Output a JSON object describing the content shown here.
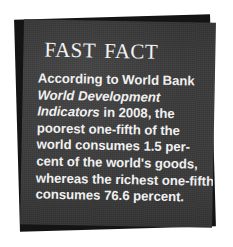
{
  "callout": {
    "kind": "fast-fact-callout",
    "title": "Fast Fact",
    "colors": {
      "page_background": "#ffffff",
      "card_front": "#3b3b3b",
      "card_back": "#141414",
      "text": "#f0f0f0",
      "title_text": "#f2f2f2"
    },
    "body": {
      "full_text": "According to World Bank World Development Indicators in 2008, the poorest one-fifth of the world consumes 1.5 percent of the world's goods, whereas the richest one-fifth consumes 76.6 percent.",
      "lines": [
        {
          "id": "line-1",
          "before": "According to World Bank",
          "italic": "",
          "after": ""
        },
        {
          "id": "line-2",
          "before": "",
          "italic": "World Development",
          "after": ""
        },
        {
          "id": "line-3",
          "before": "",
          "italic": "Indicators",
          "after": " in 2008, the"
        },
        {
          "id": "line-4",
          "before": "poorest one-fifth of the",
          "italic": "",
          "after": ""
        },
        {
          "id": "line-5",
          "before": "world consumes 1.5 per-",
          "italic": "",
          "after": ""
        },
        {
          "id": "line-6",
          "before": "cent of the world's goods,",
          "italic": "",
          "after": ""
        },
        {
          "id": "line-7",
          "before": "whereas the richest one-fifth",
          "italic": "",
          "after": ""
        },
        {
          "id": "line-8",
          "before": "consumes 76.6 percent.",
          "italic": "",
          "after": ""
        }
      ]
    },
    "facts": {
      "source_organization": "World Bank",
      "source_publication": "World Development Indicators",
      "year": "2008",
      "poorest_share_label": "poorest one-fifth",
      "poorest_consumption_percent": "1.5 percent",
      "richest_share_label": "richest one-fifth",
      "richest_consumption_percent": "76.6 percent"
    }
  }
}
